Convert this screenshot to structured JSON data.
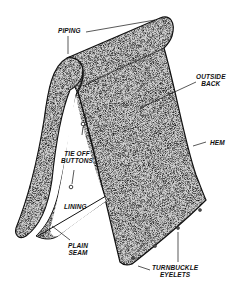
{
  "diagram": {
    "colors": {
      "fabric": "#8a8a8a",
      "outline": "#111111",
      "background": "#ffffff"
    },
    "labels": {
      "piping": "PIPING",
      "outside_back_line1": "OUTSIDE",
      "outside_back_line2": "BACK",
      "hem": "HEM",
      "tie_off_line1": "TIE OFF",
      "tie_off_line2": "BUTTONS",
      "lining": "LINING",
      "plain_seam_line1": "PLAIN",
      "plain_seam_line2": "SEAM",
      "turnbuckle_line1": "TURNBUCKLE",
      "turnbuckle_line2": "EYELETS"
    }
  }
}
